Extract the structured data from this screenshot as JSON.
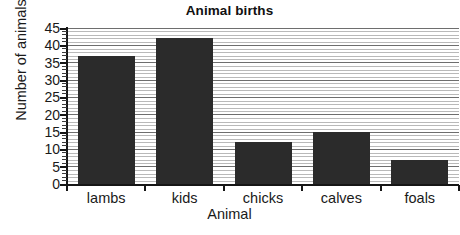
{
  "chart_data": {
    "type": "bar",
    "title": "Animal births",
    "xlabel": "Animal",
    "ylabel": "Number of animals",
    "categories": [
      "lambs",
      "kids",
      "chicks",
      "calves",
      "foals"
    ],
    "values": [
      37,
      42,
      12,
      15,
      7
    ],
    "ylim": [
      0,
      45
    ],
    "ytick_labels": [
      "0",
      "5",
      "10",
      "15",
      "20",
      "25",
      "30",
      "35",
      "40",
      "45"
    ],
    "ytick_values": [
      0,
      5,
      10,
      15,
      20,
      25,
      30,
      35,
      40,
      45
    ],
    "ytick_step": 5,
    "yminor_step": 1,
    "grid": "horizontal",
    "legend": "none",
    "bar_color": "#2b2b2b",
    "gridline_color": "#b9b9b9",
    "major_gridline_color": "#6e6e6e",
    "axis_color": "#161616",
    "background_color": "#ffffff"
  }
}
